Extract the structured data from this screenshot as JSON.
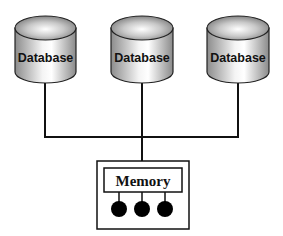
{
  "diagram": {
    "type": "shared-memory-architecture",
    "databases": [
      {
        "label": "Database"
      },
      {
        "label": "Database"
      },
      {
        "label": "Database"
      }
    ],
    "memory": {
      "label": "Memory",
      "ports": 3
    },
    "colors": {
      "line": "#111111",
      "cylinder_light": "#f2f2f2",
      "cylinder_dark": "#8a8a8a",
      "port_fill": "#000000",
      "background": "#ffffff"
    }
  }
}
